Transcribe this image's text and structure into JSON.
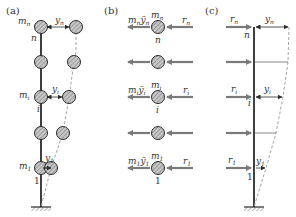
{
  "colors": {
    "ink": "#2b2b2b",
    "arrow": "#7a7a7a",
    "dashed": "#9a9a9a",
    "mass_fill": "#bdbdbd",
    "background": "#ffffff"
  },
  "panels": {
    "a": {
      "label": "(a)",
      "top_mass": "m",
      "top_mass_sub": "n",
      "top_node": "n",
      "top_disp": "y",
      "top_disp_sub": "n",
      "mid_mass": "m",
      "mid_mass_sub": "i",
      "mid_node": "i",
      "mid_disp": "y",
      "mid_disp_sub": "i",
      "bot_mass": "m",
      "bot_mass_sub": "1",
      "bot_node": "1",
      "bot_disp": "y",
      "bot_disp_sub": "1"
    },
    "b": {
      "label": "(b)",
      "top_inertia": "m",
      "top_inertia_sub": "n",
      "top_inertia_acc": "ÿ",
      "top_inertia_acc_sub": "n",
      "top_mass": "m",
      "top_mass_sub": "n",
      "top_node": "n",
      "top_force": "r",
      "top_force_sub": "n",
      "mid_inertia": "m",
      "mid_inertia_sub": "i",
      "mid_inertia_acc": "ÿ",
      "mid_inertia_acc_sub": "i",
      "mid_mass": "m",
      "mid_mass_sub": "i",
      "mid_node": "i",
      "mid_force": "r",
      "mid_force_sub": "i",
      "bot_inertia": "m",
      "bot_inertia_sub": "1",
      "bot_inertia_acc": "ÿ",
      "bot_inertia_acc_sub": "1",
      "bot_mass": "m",
      "bot_mass_sub": "1",
      "bot_node": "1",
      "bot_force": "r",
      "bot_force_sub": "1"
    },
    "c": {
      "label": "(c)",
      "top_force": "r",
      "top_force_sub": "n",
      "top_node": "n",
      "top_disp": "y",
      "top_disp_sub": "n",
      "mid_force": "r",
      "mid_force_sub": "i",
      "mid_node": "i",
      "mid_disp": "y",
      "mid_disp_sub": "i",
      "bot_force": "r",
      "bot_force_sub": "1",
      "bot_node": "1",
      "bot_disp": "y",
      "bot_disp_sub": "1"
    }
  }
}
